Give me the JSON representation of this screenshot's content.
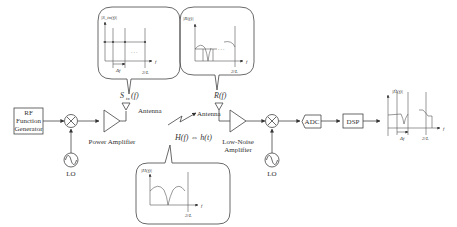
{
  "blocks": {
    "rf_generator": [
      "RF",
      "Function",
      "Generator"
    ],
    "lo_tx": "LO",
    "power_amplifier": "Power Amplifier",
    "antenna_tx": "Antenna",
    "antenna_rx": "Antenna",
    "lna": [
      "Low-Noise",
      "Amplifier"
    ],
    "lo_rx": "LO",
    "adc": "ADC",
    "dsp": "DSP"
  },
  "signals": {
    "tx_spectrum": "S",
    "tx_spectrum_sub": "tx",
    "tx_spectrum_arg": "(f)",
    "rx_spectrum": "R(f)",
    "channel": "H(f) ⇔ h(t)"
  },
  "insets": {
    "tx": {
      "ylabel": "|S_tx(f)|",
      "xlabel": "f",
      "df": "Δf",
      "end": "2/L",
      "dots": "· · ·"
    },
    "rx": {
      "ylabel": "|R(f)|",
      "xlabel": "f",
      "end": "2/L",
      "dots": "· · ·"
    },
    "channel": {
      "ylabel": "|H(f)|",
      "xlabel": "f",
      "end": "2/L"
    },
    "output": {
      "ylabel": "|Ĥ(f)|",
      "xlabel": "f",
      "df": "Δf",
      "end": "2/L"
    }
  }
}
